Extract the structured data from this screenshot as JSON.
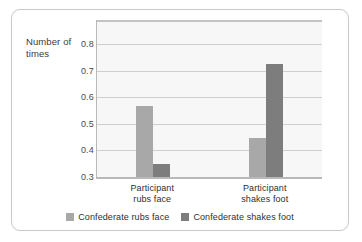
{
  "chart_data": {
    "type": "bar",
    "title": "",
    "xlabel": "",
    "ylabel": "Number of times",
    "ylim": [
      0.3,
      0.89
    ],
    "yticks": [
      0.8,
      0.7,
      0.6,
      0.5,
      0.4,
      0.3
    ],
    "ytick_labels": [
      "0.8",
      "0.7",
      "0.6",
      "0.5",
      "0.4",
      "0.3"
    ],
    "grid": true,
    "legend_position": "bottom",
    "categories": [
      "Participant rubs face",
      "Participant shakes foot"
    ],
    "category_lines": [
      [
        "Participant",
        "rubs face"
      ],
      [
        "Participant",
        "shakes foot"
      ]
    ],
    "series": [
      {
        "name": "Confederate rubs face",
        "color": "#a8a8a8",
        "values": [
          0.565,
          0.445
        ]
      },
      {
        "name": "Confederate shakes foot",
        "color": "#7d7d7d",
        "values": [
          0.35,
          0.725
        ]
      }
    ]
  },
  "legend": {
    "entries": [
      {
        "label": "Confederate rubs face",
        "swatch_name": "legend-swatch-confederate-rubs-face"
      },
      {
        "label": "Confederate shakes foot",
        "swatch_name": "legend-swatch-confederate-shakes-foot"
      }
    ]
  }
}
